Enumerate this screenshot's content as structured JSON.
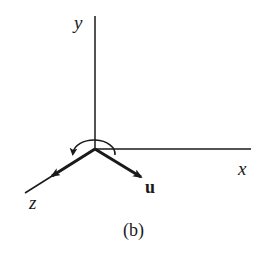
{
  "diagram": {
    "caption": "(b)",
    "axes": {
      "x": {
        "label": "x"
      },
      "y": {
        "label": "y"
      },
      "z": {
        "label": "z"
      }
    },
    "vectors": [
      {
        "label": "u",
        "direction": "down-right"
      }
    ],
    "rotation_arrow": {
      "about": "origin",
      "sense": "counterclockwise (viewed from above)"
    },
    "colors": {
      "stroke": "#1a1a1a",
      "background": "#ffffff"
    }
  }
}
